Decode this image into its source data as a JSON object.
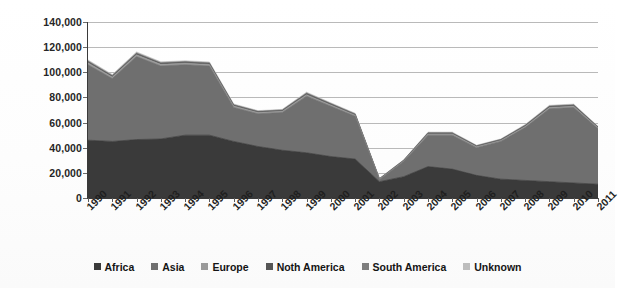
{
  "chart_data": {
    "type": "area",
    "stacked": true,
    "title": "",
    "subtitle": "",
    "xlabel": "",
    "ylabel": "",
    "ylim": [
      0,
      140000
    ],
    "ytick_step": 20000,
    "ytick_labels": [
      "0",
      "20,000",
      "40,000",
      "60,000",
      "80,000",
      "100,000",
      "120,000",
      "140,000"
    ],
    "ytick_values": [
      0,
      20000,
      40000,
      60000,
      80000,
      100000,
      120000,
      140000
    ],
    "grid": true,
    "grid_axis": "y",
    "legend_position": "bottom",
    "categories": [
      "1990",
      "1991",
      "1992",
      "1993",
      "1994",
      "1995",
      "1996",
      "1997",
      "1998",
      "1999",
      "2000",
      "2001",
      "2002",
      "2003",
      "2004",
      "2005",
      "2006",
      "2007",
      "2008",
      "2009",
      "2010",
      "2011"
    ],
    "series": [
      {
        "name": "Africa",
        "color": "#3a3a3a",
        "values": [
          46000,
          45000,
          46500,
          47000,
          50000,
          50000,
          45000,
          41000,
          38000,
          36000,
          33000,
          31000,
          13000,
          17000,
          25000,
          23000,
          18000,
          15000,
          14000,
          13000,
          12000,
          11000
        ]
      },
      {
        "name": "Asia",
        "color": "#6f6f6f",
        "values": [
          60000,
          50000,
          66000,
          58000,
          56000,
          55000,
          27000,
          26000,
          30000,
          45000,
          40000,
          34000,
          1500,
          12000,
          25000,
          27000,
          22000,
          30000,
          42000,
          58000,
          60000,
          44000
        ]
      },
      {
        "name": "Europe",
        "color": "#9a9a9a",
        "values": [
          1500,
          1200,
          1400,
          1300,
          1200,
          1200,
          1100,
          1000,
          1000,
          1200,
          1000,
          900,
          400,
          500,
          900,
          900,
          800,
          800,
          900,
          1000,
          1000,
          800
        ]
      },
      {
        "name": "Noth America",
        "color": "#565656",
        "values": [
          900,
          800,
          900,
          800,
          800,
          800,
          700,
          600,
          600,
          800,
          700,
          600,
          300,
          400,
          600,
          600,
          500,
          500,
          600,
          700,
          700,
          500
        ]
      },
      {
        "name": "South America",
        "color": "#7e7e7e",
        "values": [
          600,
          500,
          600,
          500,
          500,
          500,
          400,
          400,
          400,
          500,
          400,
          400,
          200,
          200,
          400,
          400,
          300,
          300,
          400,
          400,
          400,
          300
        ]
      },
      {
        "name": "Unknown",
        "color": "#bdbdbd",
        "values": [
          800,
          700,
          800,
          700,
          700,
          700,
          600,
          500,
          500,
          700,
          600,
          500,
          300,
          300,
          500,
          500,
          400,
          400,
          500,
          600,
          600,
          400
        ]
      }
    ],
    "totals": [
      109800,
      98200,
      116200,
      108300,
      109200,
      108200,
      74800,
      69500,
      70500,
      84200,
      75700,
      67400,
      15700,
      30400,
      52400,
      52400,
      42000,
      47000,
      58400,
      73700,
      74700,
      57000
    ]
  },
  "legend": {
    "items": [
      {
        "label": "Africa",
        "swatch_icon": "legend-swatch-icon",
        "color": "#3a3a3a"
      },
      {
        "label": "Asia",
        "swatch_icon": "legend-swatch-icon",
        "color": "#6f6f6f"
      },
      {
        "label": "Europe",
        "swatch_icon": "legend-swatch-icon",
        "color": "#9a9a9a"
      },
      {
        "label": "Noth America",
        "swatch_icon": "legend-swatch-icon",
        "color": "#565656"
      },
      {
        "label": "South America",
        "swatch_icon": "legend-swatch-icon",
        "color": "#7e7e7e"
      },
      {
        "label": "Unknown",
        "swatch_icon": "legend-swatch-icon",
        "color": "#bdbdbd"
      }
    ]
  },
  "colors": {
    "gridline": "#b9b9b9",
    "axis": "#3a3a3a",
    "text": "#1f1f1f",
    "background": "#ffffff"
  }
}
